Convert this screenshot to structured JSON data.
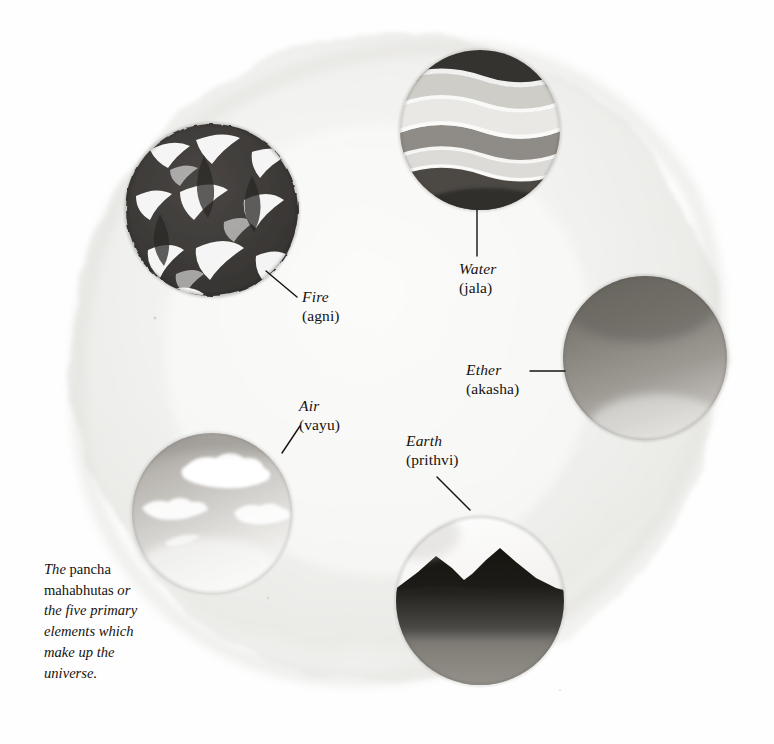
{
  "figure": {
    "kind": "watercolour-illustration",
    "background_color": "#ffffff",
    "ink_color": "#15130f",
    "wash_circle": {
      "name": "pancha-mahabhuta-wash",
      "tone": "#f1f1ef",
      "center_x": 396,
      "center_y": 358,
      "radius": 330
    }
  },
  "caption": {
    "line1_italic": "The",
    "line1_roman": " pancha",
    "line2_roman": "mahabhutas ",
    "line2_italic": "or",
    "line3_italic": "the five primary",
    "line4_italic": "elements which",
    "line5_italic": "make up the",
    "line6_italic": "universe.",
    "full_text": "The pancha mahabhutas or the five primary elements which make up the universe."
  },
  "elements": [
    {
      "id": "fire",
      "english": "Fire",
      "sanskrit": "(agni)",
      "icon": "fire-circle-icon",
      "circle": {
        "cx": 212,
        "cy": 210,
        "r": 87
      },
      "palette": {
        "dark": "#3c3a38",
        "mid": "#6d6a66",
        "light": "#ffffff"
      },
      "label_pos": {
        "x": 302,
        "y": 288,
        "align": "left"
      },
      "leader": {
        "x1": 266,
        "y1": 271,
        "x2": 297,
        "y2": 297
      }
    },
    {
      "id": "water",
      "english": "Water",
      "sanskrit": "(jala)",
      "icon": "water-circle-icon",
      "circle": {
        "cx": 480,
        "cy": 130,
        "r": 81
      },
      "palette": {
        "dark": "#3a3836",
        "mid": "#8a8784",
        "light": "#f3f3f1"
      },
      "label_pos": {
        "x": 459,
        "y": 260,
        "align": "left"
      },
      "leader": {
        "x1": 477,
        "y1": 210,
        "x2": 477,
        "y2": 256
      }
    },
    {
      "id": "ether",
      "english": "Ether",
      "sanskrit": "(akasha)",
      "icon": "ether-circle-icon",
      "circle": {
        "cx": 645,
        "cy": 358,
        "r": 83
      },
      "palette": {
        "dark": "#77746f",
        "mid": "#9b9893",
        "light": "#e6e5e2"
      },
      "label_pos": {
        "x": 466,
        "y": 361,
        "align": "left"
      },
      "leader": {
        "x1": 530,
        "y1": 371,
        "x2": 565,
        "y2": 371
      }
    },
    {
      "id": "earth",
      "english": "Earth",
      "sanskrit": "(prithvi)",
      "icon": "earth-circle-icon",
      "circle": {
        "cx": 480,
        "cy": 601,
        "r": 85
      },
      "palette": {
        "dark": "#201e1c",
        "mid": "#6e6b67",
        "light": "#f2f1ef"
      },
      "label_pos": {
        "x": 406,
        "y": 432,
        "align": "left"
      },
      "leader": {
        "x1": 437,
        "y1": 477,
        "x2": 470,
        "y2": 510
      }
    },
    {
      "id": "air",
      "english": "Air",
      "sanskrit": "(vayu)",
      "icon": "air-circle-icon",
      "circle": {
        "cx": 212,
        "cy": 513,
        "r": 81
      },
      "palette": {
        "dark": "#9d9a95",
        "mid": "#c9c7c3",
        "light": "#ffffff"
      },
      "label_pos": {
        "x": 299,
        "y": 397,
        "align": "left"
      },
      "leader": {
        "x1": 300,
        "y1": 426,
        "x2": 282,
        "y2": 453
      }
    }
  ]
}
